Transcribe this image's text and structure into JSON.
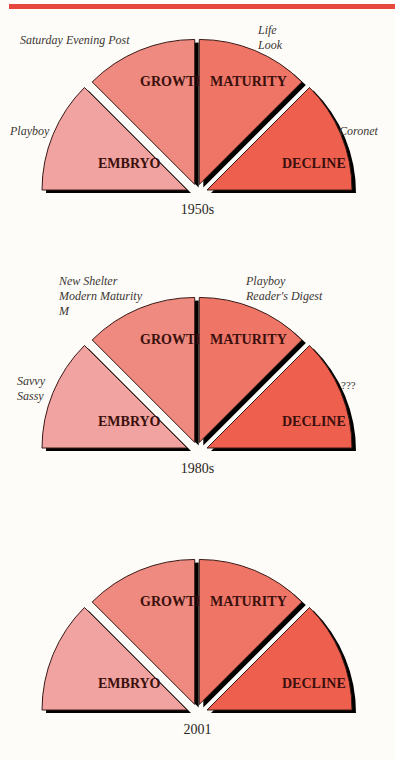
{
  "colors": {
    "rule": "#e8473d",
    "embryo": "#f0a3a0",
    "growth": "#ee8a80",
    "maturity": "#ef7566",
    "decline": "#ee5f4e",
    "shadow": "#000000"
  },
  "stages": [
    "EMBRYO",
    "GROWTH",
    "MATURITY",
    "DECLINE"
  ],
  "diagrams": [
    {
      "era": "1950s",
      "annotations": {
        "embryo": [
          "Playboy"
        ],
        "growth": [
          "Saturday Evening Post"
        ],
        "maturity": [
          "Life",
          "Look"
        ],
        "decline": [
          "Coronet"
        ]
      }
    },
    {
      "era": "1980s",
      "annotations": {
        "embryo": [
          "Savvy",
          "Sassy"
        ],
        "growth": [
          "New Shelter",
          "Modern Maturity",
          "M"
        ],
        "maturity": [
          "Playboy",
          "Reader's Digest"
        ],
        "decline": [
          "???"
        ]
      }
    },
    {
      "era": "2001",
      "annotations": {
        "embryo": [],
        "growth": [],
        "maturity": [],
        "decline": []
      }
    }
  ],
  "chart_data": [
    {
      "type": "diagram",
      "title": "1950s",
      "segments": [
        {
          "label": "EMBRYO",
          "items": [
            "Playboy"
          ]
        },
        {
          "label": "GROWTH",
          "items": [
            "Saturday Evening Post"
          ]
        },
        {
          "label": "MATURITY",
          "items": [
            "Life",
            "Look"
          ]
        },
        {
          "label": "DECLINE",
          "items": [
            "Coronet"
          ]
        }
      ]
    },
    {
      "type": "diagram",
      "title": "1980s",
      "segments": [
        {
          "label": "EMBRYO",
          "items": [
            "Savvy",
            "Sassy"
          ]
        },
        {
          "label": "GROWTH",
          "items": [
            "New Shelter",
            "Modern Maturity",
            "M"
          ]
        },
        {
          "label": "MATURITY",
          "items": [
            "Playboy",
            "Reader's Digest"
          ]
        },
        {
          "label": "DECLINE",
          "items": [
            "???"
          ]
        }
      ]
    },
    {
      "type": "diagram",
      "title": "2001",
      "segments": [
        {
          "label": "EMBRYO",
          "items": []
        },
        {
          "label": "GROWTH",
          "items": []
        },
        {
          "label": "MATURITY",
          "items": []
        },
        {
          "label": "DECLINE",
          "items": []
        }
      ]
    }
  ]
}
